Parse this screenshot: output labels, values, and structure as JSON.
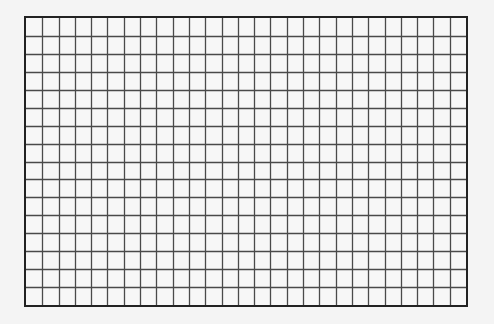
{
  "grid": {
    "columns": 27,
    "rows": 16,
    "line_color": "#4a4a4a",
    "border_color": "#222222",
    "background": "#f7f7f7"
  }
}
